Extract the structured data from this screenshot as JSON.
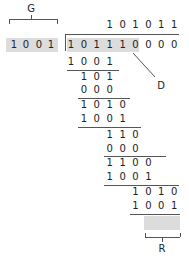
{
  "labels": {
    "generator": "G",
    "data": "D",
    "remainder": "R"
  },
  "divisor": [
    "1",
    "0",
    "0",
    "1"
  ],
  "quotient": [
    "1",
    "0",
    "1",
    "0",
    "1",
    "1"
  ],
  "dividend": [
    "1",
    "0",
    "1",
    "1",
    "1",
    "0",
    "0",
    "0",
    "0"
  ],
  "rows": [
    {
      "start": 0,
      "digits": [
        "1",
        "0",
        "0",
        "1"
      ]
    },
    {
      "start": 1,
      "digits": [
        "1",
        "0",
        "1"
      ]
    },
    {
      "start": 1,
      "digits": [
        "0",
        "0",
        "0"
      ]
    },
    {
      "start": 1,
      "digits": [
        "1",
        "0",
        "1",
        "0"
      ]
    },
    {
      "start": 1,
      "digits": [
        "1",
        "0",
        "0",
        "1"
      ]
    },
    {
      "start": 3,
      "digits": [
        "1",
        "1",
        "0"
      ]
    },
    {
      "start": 3,
      "digits": [
        "0",
        "0",
        "0"
      ]
    },
    {
      "start": 3,
      "digits": [
        "1",
        "1",
        "0",
        "0"
      ]
    },
    {
      "start": 3,
      "digits": [
        "1",
        "0",
        "0",
        "1"
      ]
    },
    {
      "start": 5,
      "digits": [
        "1",
        "0",
        "1",
        "0"
      ]
    },
    {
      "start": 5,
      "digits": [
        "1",
        "0",
        "0",
        "1"
      ]
    },
    {
      "start": 6,
      "digits": [
        "0",
        "1",
        "1"
      ]
    }
  ],
  "colors": {
    "highlight": "#dcdcdc",
    "line": "#555555",
    "text": "#222222"
  }
}
